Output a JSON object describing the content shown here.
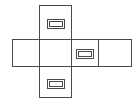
{
  "figure": {
    "background_color": "#ffffff",
    "stroke_color": "#4a4a4a",
    "stroke_width": 1,
    "canvas": {
      "width": 137,
      "height": 106
    }
  },
  "faces": [
    {
      "name": "top-face",
      "label": "top",
      "x": 39,
      "y": 5,
      "width": 32,
      "height": 34
    },
    {
      "name": "left-face",
      "label": "left",
      "x": 12,
      "y": 39,
      "width": 27,
      "height": 27
    },
    {
      "name": "front-face",
      "label": "front",
      "x": 39,
      "y": 39,
      "width": 32,
      "height": 27
    },
    {
      "name": "right-face",
      "label": "right",
      "x": 71,
      "y": 39,
      "width": 27,
      "height": 27
    },
    {
      "name": "back-face",
      "label": "back",
      "x": 98,
      "y": 39,
      "width": 33,
      "height": 27
    },
    {
      "name": "bottom-face",
      "label": "bottom",
      "x": 39,
      "y": 66,
      "width": 32,
      "height": 31
    }
  ],
  "handles": [
    {
      "name": "handle-top",
      "on_face": "top-face",
      "outer": {
        "x": 47,
        "y": 19,
        "width": 17,
        "height": 9
      },
      "inner": {
        "x": 49,
        "y": 21,
        "width": 13,
        "height": 5
      }
    },
    {
      "name": "handle-right",
      "on_face": "right-face",
      "outer": {
        "x": 76,
        "y": 49,
        "width": 17,
        "height": 9
      },
      "inner": {
        "x": 78,
        "y": 51,
        "width": 13,
        "height": 5
      }
    },
    {
      "name": "handle-bottom",
      "on_face": "bottom-face",
      "outer": {
        "x": 47,
        "y": 79,
        "width": 17,
        "height": 9
      },
      "inner": {
        "x": 49,
        "y": 81,
        "width": 13,
        "height": 5
      }
    }
  ]
}
